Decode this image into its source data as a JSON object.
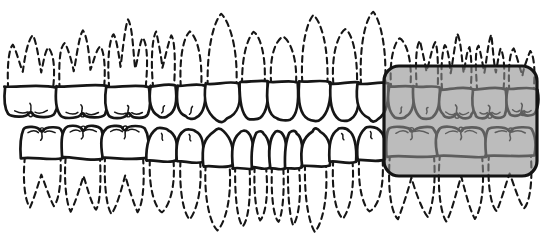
{
  "canvas": {
    "width": 556,
    "height": 240,
    "background": "#ffffff"
  },
  "style": {
    "line_color": "#161616",
    "crown_fill": "#ffffff",
    "crown_stroke_width": 2.7,
    "root_stroke_width": 2.1,
    "root_dash": "6 4.5",
    "detail_stroke_width": 1.5
  },
  "highlight": {
    "x": 384,
    "y": 66,
    "width": 153,
    "height": 110,
    "corner_radius": 15,
    "fill_color": "#8f8f8f",
    "fill_opacity": 0.6,
    "border_color": "#141414",
    "border_width": 3.2
  },
  "upper_teeth": [
    {
      "type": "molar",
      "cx": 31,
      "w": 52,
      "cy": 85,
      "crown": 32,
      "root": 45,
      "roots": 3
    },
    {
      "type": "molar",
      "cx": 82,
      "w": 50,
      "cy": 85,
      "crown": 33,
      "root": 48,
      "roots": 3
    },
    {
      "type": "molar",
      "cx": 128,
      "w": 43,
      "cy": 85,
      "crown": 33,
      "root": 58,
      "roots": 3
    },
    {
      "type": "premolar",
      "cx": 163,
      "w": 26,
      "cy": 84,
      "crown": 33,
      "root": 52,
      "roots": 2
    },
    {
      "type": "premolar",
      "cx": 191,
      "w": 27,
      "cy": 84,
      "crown": 34,
      "root": 52,
      "roots": 1
    },
    {
      "type": "canine",
      "cx": 222,
      "w": 34,
      "cy": 82,
      "crown": 40,
      "root": 68,
      "roots": 1
    },
    {
      "type": "incisor",
      "cx": 254,
      "w": 28,
      "cy": 80,
      "crown": 39,
      "root": 48,
      "roots": 1
    },
    {
      "type": "incisor",
      "cx": 283,
      "w": 31,
      "cy": 80,
      "crown": 40,
      "root": 44,
      "roots": 1
    },
    {
      "type": "incisor",
      "cx": 314,
      "w": 31,
      "cy": 80,
      "crown": 40,
      "root": 65,
      "roots": 1
    },
    {
      "type": "incisor",
      "cx": 345,
      "w": 29,
      "cy": 81,
      "crown": 39,
      "root": 52,
      "roots": 1
    },
    {
      "type": "canine",
      "cx": 373,
      "w": 30,
      "cy": 82,
      "crown": 40,
      "root": 70,
      "roots": 1
    },
    {
      "type": "premolar",
      "cx": 401,
      "w": 26,
      "cy": 85,
      "crown": 33,
      "root": 47,
      "roots": 1
    },
    {
      "type": "premolar",
      "cx": 427,
      "w": 26,
      "cy": 85,
      "crown": 33,
      "root": 45,
      "roots": 2
    },
    {
      "type": "molar",
      "cx": 457,
      "w": 34,
      "cy": 87,
      "crown": 31,
      "root": 48,
      "roots": 3
    },
    {
      "type": "molar",
      "cx": 490,
      "w": 33,
      "cy": 87,
      "crown": 31,
      "root": 46,
      "roots": 3
    },
    {
      "type": "molar",
      "cx": 522,
      "w": 30,
      "cy": 87,
      "crown": 29,
      "root": 38,
      "roots": 2
    }
  ],
  "lower_teeth": [
    {
      "type": "molar",
      "cx": 42,
      "w": 42,
      "cy": 160,
      "crown": 33,
      "root": 48,
      "roots": 2
    },
    {
      "type": "molar",
      "cx": 83,
      "w": 40,
      "cy": 160,
      "crown": 34,
      "root": 52,
      "roots": 2
    },
    {
      "type": "molar",
      "cx": 125,
      "w": 44,
      "cy": 160,
      "crown": 34,
      "root": 54,
      "roots": 2
    },
    {
      "type": "premolar",
      "cx": 162,
      "w": 30,
      "cy": 163,
      "crown": 34,
      "root": 50,
      "roots": 1
    },
    {
      "type": "premolar",
      "cx": 190,
      "w": 26,
      "cy": 164,
      "crown": 34,
      "root": 55,
      "roots": 1
    },
    {
      "type": "canine",
      "cx": 218,
      "w": 30,
      "cy": 168,
      "crown": 39,
      "root": 62,
      "roots": 1
    },
    {
      "type": "incisor",
      "cx": 243,
      "w": 20,
      "cy": 170,
      "crown": 38,
      "root": 56,
      "roots": 1
    },
    {
      "type": "incisor",
      "cx": 261,
      "w": 17,
      "cy": 170,
      "crown": 38,
      "root": 50,
      "roots": 1
    },
    {
      "type": "incisor",
      "cx": 278,
      "w": 16,
      "cy": 170,
      "crown": 38,
      "root": 52,
      "roots": 1
    },
    {
      "type": "incisor",
      "cx": 294,
      "w": 17,
      "cy": 170,
      "crown": 38,
      "root": 56,
      "roots": 1
    },
    {
      "type": "canine",
      "cx": 316,
      "w": 27,
      "cy": 168,
      "crown": 40,
      "root": 63,
      "roots": 1
    },
    {
      "type": "premolar",
      "cx": 343,
      "w": 26,
      "cy": 164,
      "crown": 35,
      "root": 54,
      "roots": 1
    },
    {
      "type": "premolar",
      "cx": 371,
      "w": 28,
      "cy": 162,
      "crown": 34,
      "root": 50,
      "roots": 1
    },
    {
      "type": "molar",
      "cx": 412,
      "w": 50,
      "cy": 158,
      "crown": 31,
      "root": 62,
      "roots": 2
    },
    {
      "type": "molar",
      "cx": 461,
      "w": 49,
      "cy": 158,
      "crown": 31,
      "root": 64,
      "roots": 2
    },
    {
      "type": "molar",
      "cx": 510,
      "w": 48,
      "cy": 157,
      "crown": 30,
      "root": 55,
      "roots": 2
    }
  ]
}
